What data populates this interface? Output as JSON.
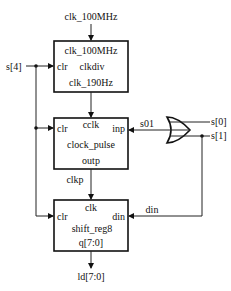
{
  "diagram": {
    "inputs": {
      "clock": "clk_100MHz",
      "clear": "s[4]",
      "s0": "s[0]",
      "s1": "s[1]"
    },
    "blocks": [
      {
        "name": "clkdiv",
        "ports": {
          "top": "clk_100MHz",
          "left": "clr",
          "bottom": "clk_190Hz"
        }
      },
      {
        "name": "clock_pulse",
        "ports": {
          "top": "cclk",
          "left": "clr",
          "right": "inp",
          "bottom": "outp"
        }
      },
      {
        "name": "shift_reg8",
        "ports": {
          "top": "clk",
          "left": "clr",
          "right": "din",
          "bottom": "q[7:0]"
        }
      }
    ],
    "gate": {
      "type": "OR",
      "output_signal": "s01"
    },
    "signals": {
      "clkp": "clkp",
      "din": "din"
    },
    "output": "ld[7:0]"
  }
}
